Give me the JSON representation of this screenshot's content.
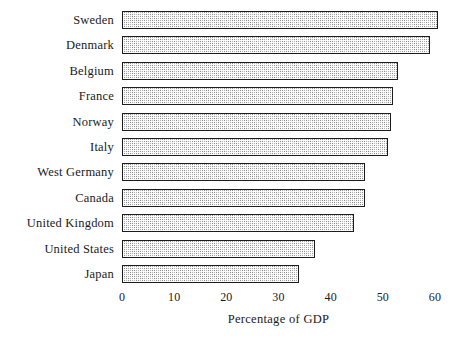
{
  "chart_data": {
    "type": "bar",
    "orientation": "horizontal",
    "title": "",
    "xlabel": "Percentage of GDP",
    "ylabel": "",
    "categories": [
      "Sweden",
      "Denmark",
      "Belgium",
      "France",
      "Norway",
      "Italy",
      "West Germany",
      "Canada",
      "United Kingdom",
      "United States",
      "Japan"
    ],
    "values": [
      60.5,
      59,
      53,
      52,
      51.5,
      51,
      46.5,
      46.5,
      44.5,
      37,
      34
    ],
    "xlim": [
      0,
      60
    ],
    "xticks": [
      0,
      10,
      20,
      30,
      40,
      50,
      60
    ],
    "xtick_labels": [
      "0",
      "10",
      "20",
      "30",
      "40",
      "50",
      "60"
    ],
    "grid": false,
    "legend": null,
    "bar_fill": "#a8a8a8",
    "bar_edge": "#1c1c1c",
    "background": "#ffffff"
  }
}
